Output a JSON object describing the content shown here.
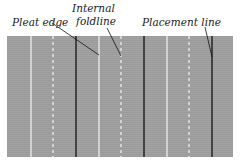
{
  "diagram": {
    "labels": {
      "pleat_edge": "Pleat edge",
      "internal_foldline_1": "Internal",
      "internal_foldline_2": "foldline",
      "placement_line": "Placement line"
    },
    "colors": {
      "fabric": "#9e9e9e",
      "pleat_edge_line": "#ffffff",
      "foldline": "#ffffff",
      "placement_line": "#111111",
      "leader": "#111111"
    },
    "lines": {
      "pleat_edges_x": [
        31,
        99,
        167
      ],
      "foldlines_x": [
        53,
        121,
        189
      ],
      "placement_lines_x": [
        76,
        144,
        212
      ]
    }
  }
}
